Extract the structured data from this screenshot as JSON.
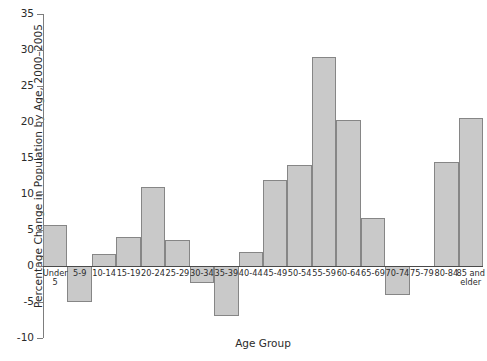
{
  "chart_data": {
    "type": "bar",
    "title": "",
    "xlabel": "Age Group",
    "ylabel": "Percentage Change in Population by Age, 2000–2005",
    "ylim": [
      -10,
      35
    ],
    "ytick_values": [
      35,
      30,
      25,
      20,
      15,
      10,
      5,
      0,
      -5,
      -10
    ],
    "ytick_labels": [
      "35",
      "30",
      "25",
      "20",
      "15",
      "10",
      "5",
      "0",
      "-5",
      "-10"
    ],
    "grid": false,
    "legend": false,
    "categories": [
      "Under 5",
      "5-9",
      "10-14",
      "15-19",
      "20-24",
      "25-29",
      "30-34",
      "35-39",
      "40-44",
      "45-49",
      "50-54",
      "55-59",
      "60-64",
      "65-69",
      "70-74",
      "75-79",
      "80-84",
      "85 and elder"
    ],
    "values": [
      5.7,
      -4.8,
      1.6,
      4.0,
      11.0,
      3.6,
      -2.2,
      -6.8,
      2.0,
      12.0,
      14.0,
      29.0,
      20.3,
      6.7,
      -3.9,
      0.0,
      14.5,
      20.5
    ],
    "bar_color": "#c9c9c9",
    "bar_edge_color": "#868686",
    "axis_color": "#4a4a4a",
    "background_color": "#ffffff"
  }
}
